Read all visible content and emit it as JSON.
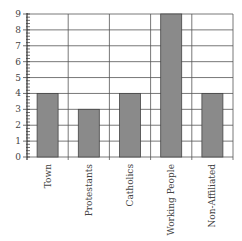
{
  "chart_data": {
    "type": "bar",
    "title": "",
    "xlabel": "",
    "ylabel": "",
    "categories": [
      "Town",
      "Protestants",
      "Catholics",
      "Working People",
      "Non-Affiliated"
    ],
    "values": [
      4,
      3,
      4,
      9,
      4
    ],
    "ylim": [
      0,
      9
    ],
    "yticks": [
      0,
      1,
      2,
      3,
      4,
      5,
      6,
      7,
      8,
      9
    ],
    "minor_ticks_per_unit": 5,
    "grid": true,
    "legend": null,
    "bar_color": "#8a8a8a",
    "grid_color": "#555555"
  }
}
